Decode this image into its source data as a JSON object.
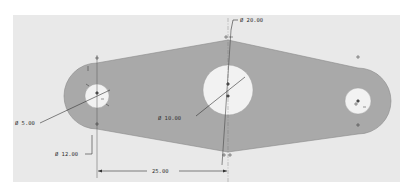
{
  "viewport": {
    "background": "#ffffff",
    "canvas_color": "#e9e9e9",
    "part_color": "#a9a9a9",
    "hole_color": "#f2f2f2",
    "line_color": "#3a3a3a"
  },
  "part": {
    "name": "link-plate",
    "holes": [
      {
        "id": "left",
        "cx": 97,
        "cy": 96,
        "outer_r": 33,
        "inner_r": 12
      },
      {
        "id": "center",
        "cx": 228,
        "cy": 90,
        "inner_r": 25
      },
      {
        "id": "right",
        "cx": 358,
        "cy": 101,
        "outer_r": 33,
        "inner_r": 13
      }
    ]
  },
  "dimensions": {
    "dia_20": "Ø 20.00",
    "dia_5": "Ø 5.00",
    "dia_10": "Ø 10.00",
    "dia_12": "Ø 12.00",
    "linear_25": "25.00"
  },
  "icons": {
    "origin_marker": "+",
    "point_marker": "⊕"
  }
}
